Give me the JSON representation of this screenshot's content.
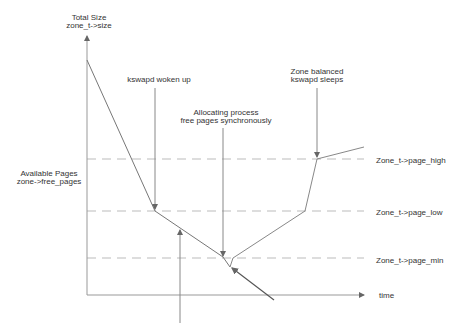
{
  "diagram": {
    "y_axis_label": {
      "line1": "Total Size",
      "line2": "zone_t->size"
    },
    "y_axis_mid_label": {
      "line1": "Available Pages",
      "line2": "zone->free_pages"
    },
    "x_axis_label": "time",
    "thresholds": [
      {
        "key": "page_high",
        "label": "Zone_t->page_high"
      },
      {
        "key": "page_low",
        "label": "Zone_t->page_low"
      },
      {
        "key": "page_min",
        "label": "Zone_t->page_min"
      }
    ],
    "annotations": [
      {
        "key": "kswapd_woken",
        "line1": "kswapd woken up"
      },
      {
        "key": "allocating",
        "line1": "Allocating process",
        "line2": "free pages synchronously"
      },
      {
        "key": "zone_balanced",
        "line1": "Zone balanced",
        "line2": "kswapd sleeps"
      }
    ],
    "colors": {
      "line": "#777777",
      "dash": "#bbbbbb",
      "text": "#333333",
      "arrow": "#555555"
    }
  }
}
